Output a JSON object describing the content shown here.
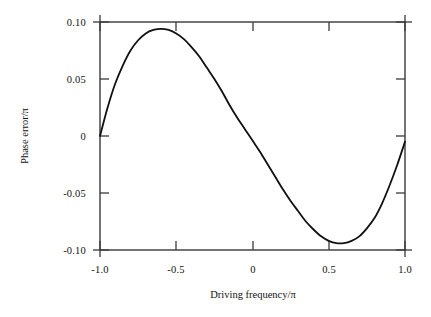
{
  "chart_data": {
    "type": "line",
    "title": "",
    "xlabel": "Driving frequency/π",
    "ylabel": "Phase error/π",
    "xlim": [
      -1.0,
      1.0
    ],
    "ylim": [
      -0.1,
      0.1
    ],
    "grid": false,
    "legend": null,
    "xticks": [
      -1.0,
      -0.5,
      0,
      0.5,
      1.0
    ],
    "xticklabels": [
      "-1.0",
      "-0.5",
      "0",
      "0.5",
      "1.0"
    ],
    "yticks": [
      0.1,
      0.05,
      0,
      -0.05,
      -0.1
    ],
    "yticklabels": [
      "0.10",
      "0.05",
      "0",
      "-0.05",
      "-0.10"
    ],
    "line_color": "#111111",
    "line_width": 1.8,
    "series": [
      {
        "name": "phase error",
        "x": [
          -1.0,
          -0.95,
          -0.9,
          -0.85,
          -0.8,
          -0.75,
          -0.7,
          -0.65,
          -0.6,
          -0.55,
          -0.5,
          -0.45,
          -0.4,
          -0.35,
          -0.3,
          -0.25,
          -0.2,
          -0.15,
          -0.1,
          -0.05,
          0.0,
          0.05,
          0.1,
          0.15,
          0.2,
          0.25,
          0.3,
          0.35,
          0.4,
          0.45,
          0.5,
          0.55,
          0.6,
          0.65,
          0.7,
          0.75,
          0.8,
          0.85,
          0.9,
          0.95,
          1.0
        ],
        "y": [
          0.0,
          0.025,
          0.046,
          0.062,
          0.075,
          0.084,
          0.09,
          0.093,
          0.094,
          0.093,
          0.09,
          0.085,
          0.078,
          0.07,
          0.06,
          0.05,
          0.039,
          0.027,
          0.016,
          0.006,
          -0.004,
          -0.014,
          -0.025,
          -0.036,
          -0.047,
          -0.057,
          -0.066,
          -0.075,
          -0.082,
          -0.088,
          -0.092,
          -0.094,
          -0.094,
          -0.092,
          -0.088,
          -0.081,
          -0.072,
          -0.059,
          -0.043,
          -0.025,
          -0.005
        ]
      }
    ],
    "annotations": {
      "peak": {
        "x": -0.6,
        "y": 0.094
      },
      "trough": {
        "x": 0.58,
        "y": -0.094
      },
      "zero_crossing": {
        "x": 0.0,
        "y": 0.0
      },
      "start": {
        "x": -1.0,
        "y": 0.0
      },
      "end": {
        "x": 1.0,
        "y": -0.005
      }
    }
  },
  "axes": {
    "frame_color": "#333333",
    "background": "#ffffff",
    "tick_direction": "in"
  }
}
